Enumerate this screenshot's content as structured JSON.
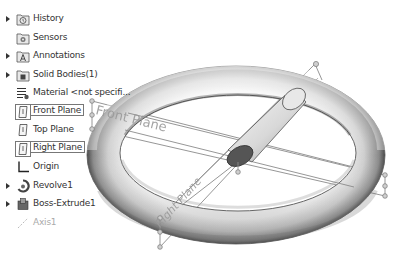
{
  "feature_tree": {
    "items": [
      {
        "label": "History",
        "icon": "history-folder-icon",
        "expandable": true,
        "selected": false
      },
      {
        "label": "Sensors",
        "icon": "sensors-folder-icon",
        "expandable": false,
        "selected": false
      },
      {
        "label": "Annotations",
        "icon": "annotations-folder-icon",
        "expandable": true,
        "selected": false
      },
      {
        "label": "Solid Bodies(1)",
        "icon": "solid-bodies-folder-icon",
        "expandable": true,
        "selected": false
      },
      {
        "label": "Material <not specifi...",
        "icon": "material-icon",
        "expandable": false,
        "selected": false
      },
      {
        "label": "Front Plane",
        "icon": "plane-icon",
        "expandable": false,
        "selected": true
      },
      {
        "label": "Top Plane",
        "icon": "plane-icon",
        "expandable": false,
        "selected": false
      },
      {
        "label": "Right Plane",
        "icon": "plane-icon",
        "expandable": false,
        "selected": true
      },
      {
        "label": "Origin",
        "icon": "origin-icon",
        "expandable": false,
        "selected": false
      },
      {
        "label": "Revolve1",
        "icon": "revolve-icon",
        "expandable": true,
        "selected": false
      },
      {
        "label": "Boss-Extrude1",
        "icon": "extrude-icon",
        "expandable": true,
        "selected": false
      },
      {
        "label": "Axis1",
        "icon": "axis-icon",
        "expandable": false,
        "selected": false,
        "dimmed": true
      }
    ]
  },
  "graphics_area": {
    "plane_labels": {
      "front": "Front Plane",
      "right": "Right Plane"
    },
    "colors": {
      "plane_line": "#8a8a8a",
      "label_text": "#9a9a9a",
      "torus_dark": "#4a4a4a",
      "torus_light": "#f2f2f2",
      "cylinder_end": "#555555"
    }
  }
}
